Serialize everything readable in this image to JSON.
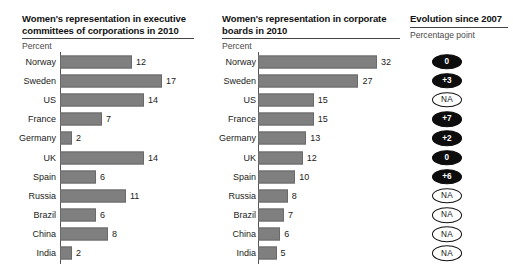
{
  "panels": {
    "exec": {
      "title": "Women's representation in executive committees of corporations in 2010",
      "unit": "Percent"
    },
    "board": {
      "title": "Women's representation in corporate boards in 2010",
      "unit": "Percent"
    },
    "evolution": {
      "title": "Evolution since 2007",
      "unit": "Percentage point"
    }
  },
  "categories": [
    "Norway",
    "Sweden",
    "US",
    "France",
    "Germany",
    "UK",
    "Spain",
    "Russia",
    "Brazil",
    "China",
    "India"
  ],
  "evolution_badges": [
    {
      "label": "0",
      "style": "filled"
    },
    {
      "label": "+3",
      "style": "filled"
    },
    {
      "label": "NA",
      "style": "outline"
    },
    {
      "label": "+7",
      "style": "filled"
    },
    {
      "label": "+2",
      "style": "filled"
    },
    {
      "label": "0",
      "style": "filled"
    },
    {
      "label": "+6",
      "style": "filled"
    },
    {
      "label": "NA",
      "style": "outline"
    },
    {
      "label": "NA",
      "style": "outline"
    },
    {
      "label": "NA",
      "style": "outline"
    },
    {
      "label": "NA",
      "style": "outline"
    }
  ],
  "colors": {
    "bar": "#7f7f7f",
    "badge_filled_bg": "#0d0d0d",
    "badge_filled_text": "#ffffff",
    "badge_outline_border": "#111111",
    "axis": "#555555",
    "text": "#222222"
  },
  "chart_data": [
    {
      "type": "bar",
      "orientation": "horizontal",
      "title": "Women's representation in executive committees of corporations in 2010",
      "xlabel": "Percent",
      "ylabel": "",
      "categories": [
        "Norway",
        "Sweden",
        "US",
        "France",
        "Germany",
        "UK",
        "Spain",
        "Russia",
        "Brazil",
        "China",
        "India"
      ],
      "values": [
        12,
        17,
        14,
        7,
        2,
        14,
        6,
        11,
        6,
        8,
        2
      ],
      "data_labels": [
        "12",
        "17",
        "14",
        "7",
        "2",
        "14",
        "6",
        "11",
        "6",
        "8",
        "2"
      ],
      "xlim": [
        0,
        17
      ],
      "grid": false,
      "legend": "none"
    },
    {
      "type": "bar",
      "orientation": "horizontal",
      "title": "Women's representation in corporate boards in 2010",
      "xlabel": "Percent",
      "ylabel": "",
      "categories": [
        "Norway",
        "Sweden",
        "US",
        "France",
        "Germany",
        "UK",
        "Spain",
        "Russia",
        "Brazil",
        "China",
        "India"
      ],
      "values": [
        32,
        27,
        15,
        15,
        13,
        12,
        10,
        8,
        7,
        6,
        5
      ],
      "data_labels": [
        "32",
        "27",
        "15",
        "15",
        "13",
        "12",
        "10",
        "8",
        "7",
        "6",
        "5"
      ],
      "xlim": [
        0,
        32
      ],
      "grid": false,
      "legend": "none"
    },
    {
      "type": "table",
      "title": "Evolution since 2007",
      "xlabel": "Percentage point",
      "categories": [
        "Norway",
        "Sweden",
        "US",
        "France",
        "Germany",
        "UK",
        "Spain",
        "Russia",
        "Brazil",
        "China",
        "India"
      ],
      "values": [
        "0",
        "+3",
        "NA",
        "+7",
        "+2",
        "0",
        "+6",
        "NA",
        "NA",
        "NA",
        "NA"
      ]
    }
  ]
}
